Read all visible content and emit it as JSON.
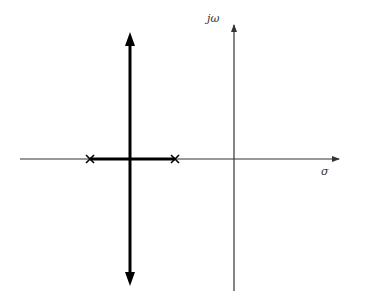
{
  "diagram": {
    "type": "root-locus",
    "axes": {
      "imaginary_label": "jω",
      "real_label": "σ",
      "origin": {
        "x": 234,
        "y": 159
      },
      "real_axis": {
        "x_start": 20,
        "x_end": 339
      },
      "imag_axis": {
        "y_top": 24,
        "y_bottom": 291
      }
    },
    "poles": [
      {
        "label": "pole-1",
        "x": 90,
        "y": 159
      },
      {
        "label": "pole-2",
        "x": 175,
        "y": 159
      }
    ],
    "locus": {
      "real_segment": {
        "x_start": 90,
        "x_end": 175,
        "y": 159
      },
      "vertical_branch": {
        "x": 130,
        "y_top": 32,
        "y_bottom": 286
      }
    },
    "colors": {
      "axis": "#333333",
      "locus": "#000000",
      "background": "#ffffff"
    }
  }
}
